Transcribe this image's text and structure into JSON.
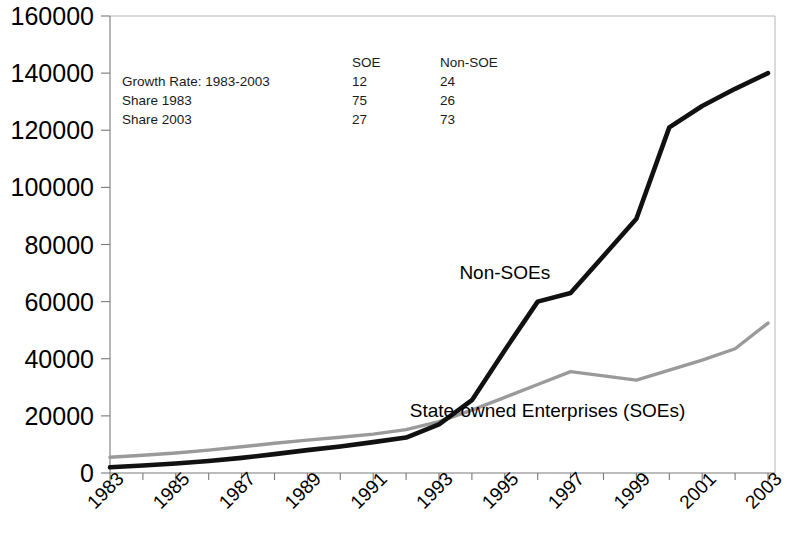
{
  "chart_data": {
    "type": "line",
    "title": "",
    "subtitle": "",
    "xlabel": "",
    "ylabel": "",
    "grid": false,
    "legend_position": "inline-annotation",
    "x": [
      1983,
      1984,
      1985,
      1986,
      1987,
      1988,
      1989,
      1990,
      1991,
      1992,
      1993,
      1994,
      1995,
      1996,
      1997,
      1998,
      1999,
      2000,
      2001,
      2002,
      2003
    ],
    "xlim": [
      1983,
      2003
    ],
    "ylim": [
      0,
      160000
    ],
    "ytick_labels": [
      "0",
      "20000",
      "40000",
      "60000",
      "80000",
      "100000",
      "120000",
      "140000",
      "160000"
    ],
    "ytick_values": [
      0,
      20000,
      40000,
      60000,
      80000,
      100000,
      120000,
      140000,
      160000
    ],
    "xtick_labels": [
      "1983",
      "1985",
      "1987",
      "1989",
      "1991",
      "1993",
      "1995",
      "1997",
      "1999",
      "2001",
      "2003"
    ],
    "xtick_values": [
      1983,
      1985,
      1987,
      1989,
      1991,
      1993,
      1995,
      1997,
      1999,
      2001,
      2003
    ],
    "series": [
      {
        "name": "State-owned Enterprises (SOEs)",
        "color": "#9a9a9a",
        "values": [
          5500,
          6200,
          7000,
          8000,
          9200,
          10400,
          11500,
          12500,
          13600,
          15200,
          18000,
          22000,
          26500,
          31000,
          35500,
          34000,
          32500,
          36000,
          39500,
          43500,
          52500
        ]
      },
      {
        "name": "Non-SOEs",
        "color": "#111111",
        "values": [
          2000,
          2600,
          3300,
          4200,
          5300,
          6600,
          8000,
          9300,
          10800,
          12400,
          17000,
          25500,
          43000,
          60000,
          63000,
          76000,
          89000,
          121000,
          128500,
          134500,
          140000
        ]
      }
    ],
    "series_labels": [
      {
        "text": "Non-SOEs",
        "x": 1995.0,
        "y": 68000
      },
      {
        "text": "State-owned Enterprises (SOEs)",
        "x": 1996.3,
        "y": 19500
      }
    ],
    "annotation_table": {
      "column_headers": [
        "",
        "SOE",
        "Non-SOE"
      ],
      "rows": [
        {
          "label": "Growth Rate: 1983-2003",
          "soe": "12",
          "non_soe": "24"
        },
        {
          "label": "Share 1983",
          "soe": "75",
          "non_soe": "26"
        },
        {
          "label": "Share 2003",
          "soe": "27",
          "non_soe": "73"
        }
      ]
    }
  }
}
